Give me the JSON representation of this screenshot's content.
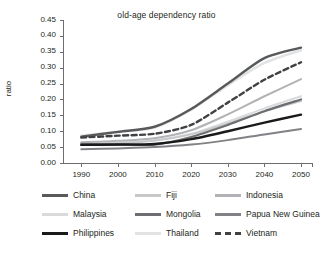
{
  "chart_data": {
    "type": "line",
    "title": "old-age dependency ratio",
    "xlabel": "",
    "ylabel": "ratio",
    "x": [
      1990,
      2000,
      2010,
      2020,
      2030,
      2040,
      2050
    ],
    "xlim": [
      1985,
      2053
    ],
    "ylim": [
      0.0,
      0.45
    ],
    "y_ticks": [
      0.0,
      0.05,
      0.1,
      0.15,
      0.2,
      0.25,
      0.3,
      0.35,
      0.4,
      0.45
    ],
    "y_tick_labels": [
      "0.00",
      "0.05",
      "0.10",
      "0.15",
      "0.20",
      "0.25",
      "0.30",
      "0.35",
      "0.40",
      "0.45"
    ],
    "x_tick_labels": [
      "1990",
      "2000",
      "2010",
      "2020",
      "2030",
      "2040",
      "2050"
    ],
    "grid": false,
    "legend_position": "bottom",
    "legend_columns": 3,
    "series": [
      {
        "name": "China",
        "color": "#58595b",
        "width": 2.4,
        "dash": "none",
        "values": [
          0.083,
          0.098,
          0.114,
          0.17,
          0.25,
          0.33,
          0.363
        ]
      },
      {
        "name": "Fiji",
        "color": "#c7c8ca",
        "width": 2.0,
        "dash": "none",
        "values": [
          0.058,
          0.062,
          0.07,
          0.09,
          0.124,
          0.163,
          0.195
        ]
      },
      {
        "name": "Indonesia",
        "color": "#b1b3b6",
        "width": 2.0,
        "dash": "none",
        "values": [
          0.065,
          0.07,
          0.078,
          0.103,
          0.153,
          0.21,
          0.264
        ]
      },
      {
        "name": "Malaysia",
        "color": "#d9dadb",
        "width": 2.0,
        "dash": "none",
        "values": [
          0.062,
          0.064,
          0.072,
          0.092,
          0.13,
          0.172,
          0.21
        ]
      },
      {
        "name": "Mongolia",
        "color": "#6d6e71",
        "width": 2.2,
        "dash": "none",
        "values": [
          0.06,
          0.058,
          0.058,
          0.082,
          0.12,
          0.163,
          0.2
        ]
      },
      {
        "name": "Papua New Guinea",
        "color": "#808285",
        "width": 2.0,
        "dash": "none",
        "values": [
          0.043,
          0.046,
          0.05,
          0.058,
          0.072,
          0.09,
          0.107
        ]
      },
      {
        "name": "Philippines",
        "color": "#1a1a1a",
        "width": 2.4,
        "dash": "none",
        "values": [
          0.057,
          0.058,
          0.06,
          0.075,
          0.1,
          0.127,
          0.152
        ]
      },
      {
        "name": "Thailand",
        "color": "#e2e3e4",
        "width": 2.6,
        "dash": "none",
        "values": [
          0.086,
          0.098,
          0.112,
          0.168,
          0.245,
          0.315,
          0.355
        ]
      },
      {
        "name": "Vietnam",
        "color": "#414042",
        "width": 2.4,
        "dash": "dashed",
        "values": [
          0.08,
          0.086,
          0.092,
          0.12,
          0.19,
          0.262,
          0.317
        ]
      }
    ]
  },
  "legend": {
    "rows": [
      [
        {
          "label": "China",
          "color": "#58595b",
          "dash": "none"
        },
        {
          "label": "Fiji",
          "color": "#c7c8ca",
          "dash": "none"
        },
        {
          "label": "Indonesia",
          "color": "#b1b3b6",
          "dash": "none"
        }
      ],
      [
        {
          "label": "Malaysia",
          "color": "#d9dadb",
          "dash": "none"
        },
        {
          "label": "Mongolia",
          "color": "#6d6e71",
          "dash": "none"
        },
        {
          "label": "Papua New Guinea",
          "color": "#808285",
          "dash": "none"
        }
      ],
      [
        {
          "label": "Philippines",
          "color": "#1a1a1a",
          "dash": "none"
        },
        {
          "label": "Thailand",
          "color": "#e2e3e4",
          "dash": "none"
        },
        {
          "label": "Vietnam",
          "color": "#414042",
          "dash": "dashed"
        }
      ]
    ]
  },
  "axis": {
    "color": "#6d6e71"
  }
}
